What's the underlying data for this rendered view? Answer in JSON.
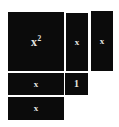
{
  "figure": {
    "name": "algebra-tiles-diagram",
    "background_color": "#ffffff",
    "tile_color": "#0b0b0b",
    "label_color": "#e8e6e1",
    "tiles": [
      {
        "id": "x-squared",
        "label_base": "x",
        "label_exponent": "2",
        "shape": "large-square",
        "area": "x^2"
      },
      {
        "id": "x-vertical-1",
        "label_base": "x",
        "shape": "vertical-rectangle",
        "area": "x"
      },
      {
        "id": "x-vertical-2",
        "label_base": "x",
        "shape": "vertical-rectangle",
        "area": "x"
      },
      {
        "id": "unit-1",
        "label_base": "1",
        "shape": "unit-square",
        "area": "1"
      },
      {
        "id": "x-horizontal-1",
        "label_base": "x",
        "shape": "horizontal-rectangle",
        "area": "x"
      },
      {
        "id": "x-horizontal-2",
        "label_base": "x",
        "shape": "horizontal-rectangle",
        "area": "x"
      }
    ]
  }
}
